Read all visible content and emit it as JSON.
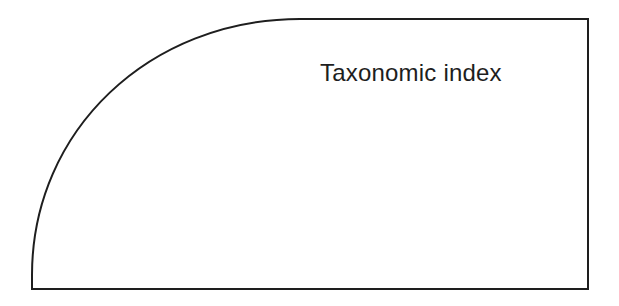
{
  "diagram": {
    "label": "Taxonomic index",
    "shape": "quarter-rounded-rectangle",
    "stroke_color": "#1e1e1e",
    "background": "#ffffff"
  }
}
